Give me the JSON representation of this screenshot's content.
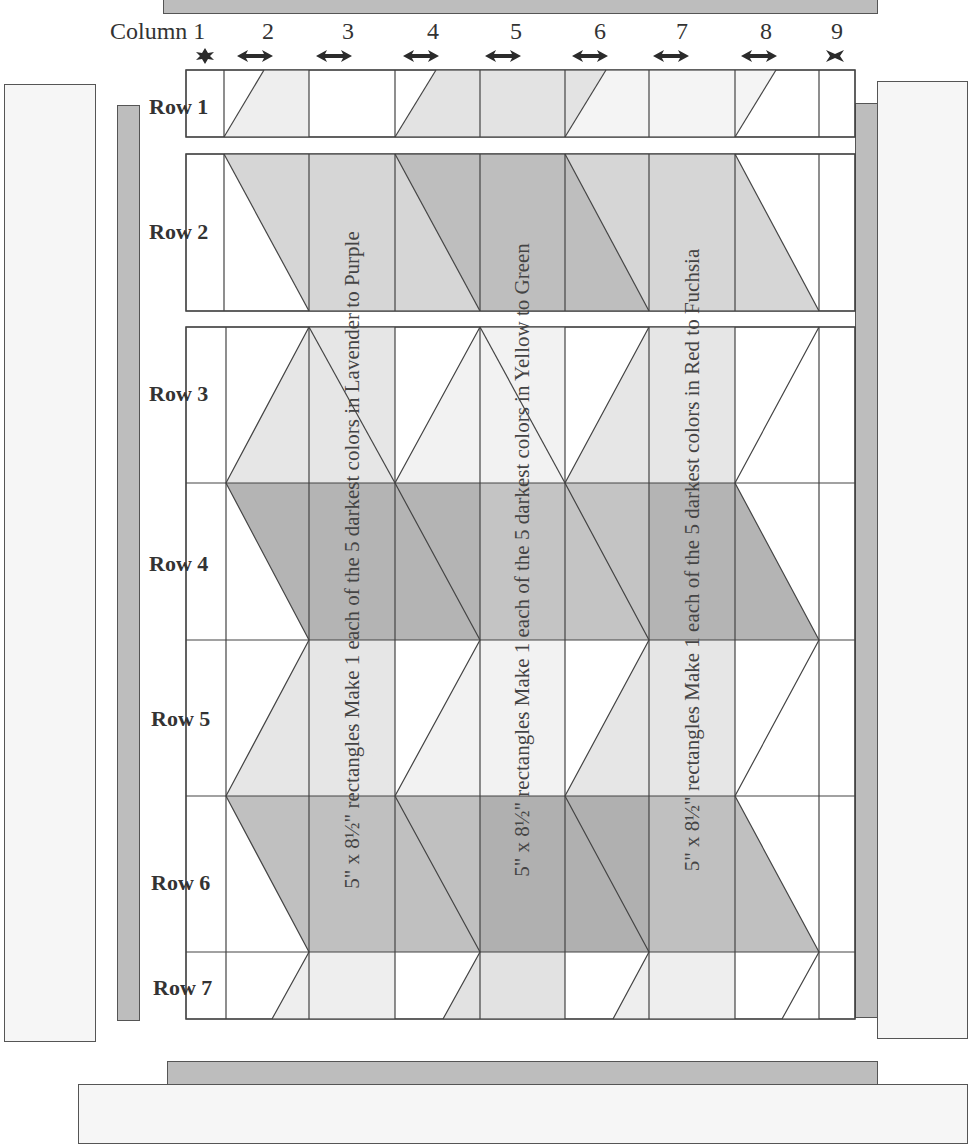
{
  "header": {
    "column_title": "Column 1",
    "column_numbers": [
      "2",
      "3",
      "4",
      "5",
      "6",
      "7",
      "8",
      "9"
    ],
    "column_markers": [
      "star",
      "double-arrow",
      "double-arrow",
      "double-arrow",
      "double-arrow",
      "double-arrow",
      "double-arrow",
      "double-arrow",
      "star"
    ]
  },
  "rows": [
    {
      "label": "Row 1"
    },
    {
      "label": "Row 2"
    },
    {
      "label": "Row 3"
    },
    {
      "label": "Row 4"
    },
    {
      "label": "Row 5"
    },
    {
      "label": "Row 6"
    },
    {
      "label": "Row 7"
    }
  ],
  "instructions": [
    {
      "text": "5\" x 8½\" rectangles Make 1 each of the 5 darkest colors in Lavender to Purple",
      "column": 3
    },
    {
      "text": "5\" x 8½\" rectangles Make 1 each of the 5 darkest colors in Yellow to Green",
      "column": 5
    },
    {
      "text": "5\" x 8½\" rectangles Make 1 each of the 5 darkest colors in Red to Fuchsia",
      "column": 7
    }
  ],
  "colors": {
    "white": "#ffffff",
    "very_light": "#eeeeee",
    "light": "#dcdcdc",
    "medium": "#c8c8c8",
    "dark": "#b0b0b0",
    "border_dark": "#bdbdbd",
    "border_light": "#f6f6f6",
    "line": "#444444"
  }
}
